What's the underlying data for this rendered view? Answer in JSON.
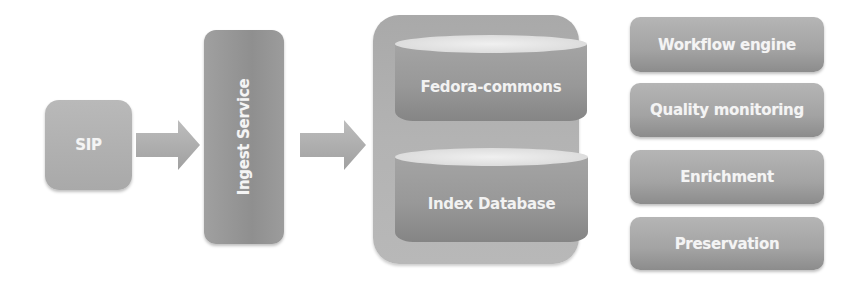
{
  "diagram": {
    "sip": {
      "label": "SIP"
    },
    "ingest_service": {
      "label": "Ingest Service"
    },
    "repository": {
      "stores": [
        {
          "label": "Fedora-commons"
        },
        {
          "label": "Index Database"
        }
      ]
    },
    "services": [
      {
        "label": "Workflow engine"
      },
      {
        "label": "Quality monitoring"
      },
      {
        "label": "Enrichment"
      },
      {
        "label": "Preservation"
      }
    ],
    "connections": [
      {
        "from": "SIP",
        "to": "Ingest Service",
        "type": "arrow"
      },
      {
        "from": "Ingest Service",
        "to": "Repository",
        "type": "arrow"
      }
    ],
    "colors": {
      "box_fill": "#a6a6a6",
      "text": "#f4f4f4",
      "cylinder_top": "#e6e6e6",
      "background": "#ffffff"
    }
  }
}
